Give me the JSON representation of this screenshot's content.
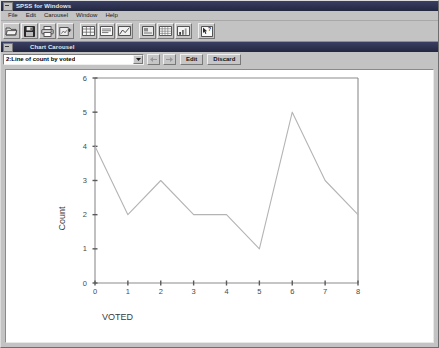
{
  "app": {
    "title": "SPSS for Windows",
    "menu": [
      {
        "label": "File"
      },
      {
        "label": "Edit"
      },
      {
        "label": "Carousel"
      },
      {
        "label": "Window"
      },
      {
        "label": "Help"
      }
    ],
    "toolbar": [
      {
        "name": "open-file-icon"
      },
      {
        "name": "save-file-icon"
      },
      {
        "name": "print-icon"
      },
      {
        "name": "export-chart-icon"
      },
      {
        "name": "data-editor-icon"
      },
      {
        "name": "output-window-icon"
      },
      {
        "name": "chart-window-icon"
      },
      {
        "name": "syntax-window-icon"
      },
      {
        "name": "grid-icon"
      },
      {
        "name": "bar-chart-icon"
      },
      {
        "name": "help-pointer-icon"
      }
    ]
  },
  "carousel": {
    "title": "Chart Carousel",
    "selected_chart": "2:Line of count by voted",
    "prev_label": "←",
    "next_label": "→",
    "edit_label": "Edit",
    "discard_label": "Discard"
  },
  "chart_data": {
    "type": "line",
    "title": "",
    "xlabel": "VOTED",
    "ylabel": "Count",
    "x": [
      0,
      1,
      2,
      3,
      4,
      5,
      6,
      7,
      8
    ],
    "values": [
      4,
      2,
      3,
      2,
      2,
      1,
      5,
      3,
      2
    ],
    "xticklabels": [
      "0",
      "1",
      "2",
      "3",
      "4",
      "5",
      "6",
      "7",
      "8"
    ],
    "yticklabels": [
      "0",
      "1",
      "2",
      "3",
      "4",
      "5",
      "6"
    ],
    "xlim": [
      0,
      8
    ],
    "ylim": [
      0,
      6
    ],
    "grid": false,
    "legend": false,
    "line_color": "#b4b4b4",
    "axis_color": "#8c8c8c"
  }
}
